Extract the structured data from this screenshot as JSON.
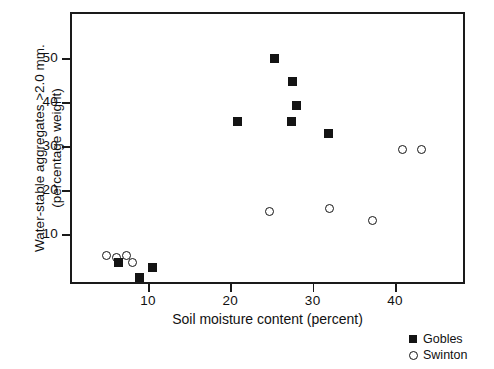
{
  "chart_data": {
    "type": "scatter",
    "title": "",
    "xlabel": "Soil moisture content (percent)",
    "ylabel_line1": "Water-stable aggregates >2.0 mm.",
    "ylabel_line2": "(percentage weight)",
    "xlim": [
      2.5,
      50.5
    ],
    "ylim": [
      0,
      62
    ],
    "xticks": [
      10,
      20,
      30,
      40
    ],
    "yticks": [
      10,
      20,
      30,
      40,
      50
    ],
    "xtick_labels": [
      "10",
      "20",
      "30",
      "40"
    ],
    "ytick_labels": [
      "10",
      "20",
      "30",
      "40",
      "50"
    ],
    "grid": false,
    "legend_position": "outside bottom-right",
    "series": [
      {
        "name": "Gobles",
        "marker": "filled-square",
        "color": "#141414",
        "points": [
          {
            "x": 6.4,
            "y": 3.6
          },
          {
            "x": 9.0,
            "y": 0.2
          },
          {
            "x": 10.6,
            "y": 2.3
          },
          {
            "x": 20.9,
            "y": 35.5
          },
          {
            "x": 25.4,
            "y": 50.0
          },
          {
            "x": 27.4,
            "y": 35.5
          },
          {
            "x": 27.5,
            "y": 44.6
          },
          {
            "x": 28.0,
            "y": 39.1
          },
          {
            "x": 31.9,
            "y": 32.8
          }
        ]
      },
      {
        "name": "Swinton",
        "marker": "open-circle",
        "color": "#141414",
        "points": [
          {
            "x": 5.0,
            "y": 5.2
          },
          {
            "x": 6.2,
            "y": 4.7
          },
          {
            "x": 7.4,
            "y": 5.2
          },
          {
            "x": 8.1,
            "y": 3.5
          },
          {
            "x": 24.7,
            "y": 15.2
          },
          {
            "x": 32.1,
            "y": 15.7
          },
          {
            "x": 37.3,
            "y": 13.0
          },
          {
            "x": 40.9,
            "y": 29.2
          },
          {
            "x": 43.2,
            "y": 29.3
          }
        ]
      }
    ]
  },
  "legend": {
    "entries": [
      {
        "label": "Gobles"
      },
      {
        "label": "Swinton"
      }
    ]
  }
}
